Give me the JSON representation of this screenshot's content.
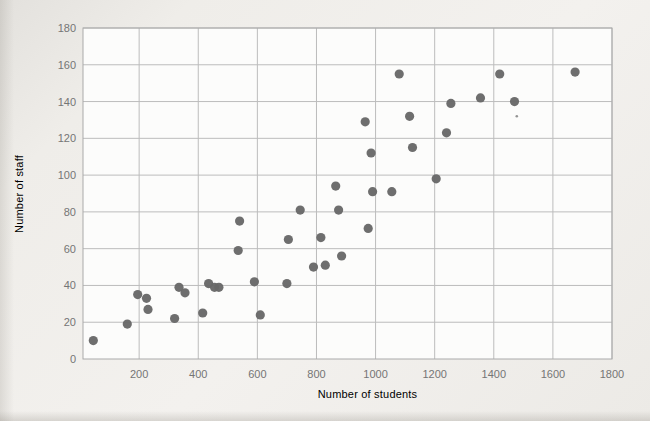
{
  "page": {
    "background_color": "#eceae6"
  },
  "chart_data": {
    "type": "scatter",
    "title": "",
    "xlabel": "Number of students",
    "ylabel": "Number of staff",
    "xlim": [
      10,
      1800
    ],
    "ylim": [
      0,
      180
    ],
    "xticks": [
      200,
      400,
      600,
      800,
      1000,
      1200,
      1400,
      1600,
      1800
    ],
    "yticks": [
      0,
      20,
      40,
      60,
      80,
      100,
      120,
      140,
      160,
      180
    ],
    "grid": true,
    "legend": false,
    "plot_bg": "#fcfcfb",
    "grid_color": "#bcbcbc",
    "border_color": "#aaaaaa",
    "label_color": "#757575",
    "point_color": "#686868",
    "point_radius": 4.6,
    "points": [
      [
        45,
        10
      ],
      [
        160,
        19
      ],
      [
        195,
        35
      ],
      [
        225,
        33
      ],
      [
        230,
        27
      ],
      [
        320,
        22
      ],
      [
        335,
        39
      ],
      [
        355,
        36
      ],
      [
        415,
        25
      ],
      [
        435,
        41
      ],
      [
        455,
        39
      ],
      [
        470,
        39
      ],
      [
        535,
        59
      ],
      [
        540,
        75
      ],
      [
        590,
        42
      ],
      [
        610,
        24
      ],
      [
        700,
        41
      ],
      [
        705,
        65
      ],
      [
        745,
        81
      ],
      [
        790,
        50
      ],
      [
        815,
        66
      ],
      [
        830,
        51
      ],
      [
        865,
        94
      ],
      [
        875,
        81
      ],
      [
        885,
        56
      ],
      [
        965,
        129
      ],
      [
        975,
        71
      ],
      [
        985,
        112
      ],
      [
        990,
        91
      ],
      [
        1055,
        91
      ],
      [
        1080,
        155
      ],
      [
        1115,
        132
      ],
      [
        1125,
        115
      ],
      [
        1205,
        98
      ],
      [
        1240,
        123
      ],
      [
        1255,
        139
      ],
      [
        1355,
        142
      ],
      [
        1420,
        155
      ],
      [
        1470,
        140
      ],
      [
        1675,
        156
      ]
    ],
    "artifact_speck": {
      "x": 1478,
      "y": 132
    }
  }
}
